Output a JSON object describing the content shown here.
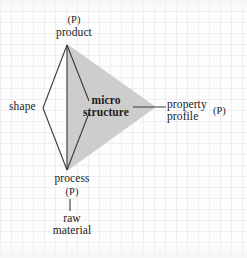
{
  "diagram": {
    "nodes": {
      "product": {
        "label": "product",
        "tag": "(P)"
      },
      "shape": {
        "label": "shape"
      },
      "microstructure": {
        "label_line1": "micro",
        "label_line2": "structure"
      },
      "property": {
        "label_line1": "property",
        "label_line2": "profile",
        "tag": "(P)"
      },
      "process": {
        "label": "process",
        "tag": "(P)"
      },
      "raw": {
        "label_line1": "raw",
        "label_line2": "material"
      }
    },
    "colors": {
      "shade_fill": "#cdcdcd",
      "stroke": "#3a3a3a",
      "text": "#1c1c1c",
      "background": "#fbfbfb"
    }
  }
}
